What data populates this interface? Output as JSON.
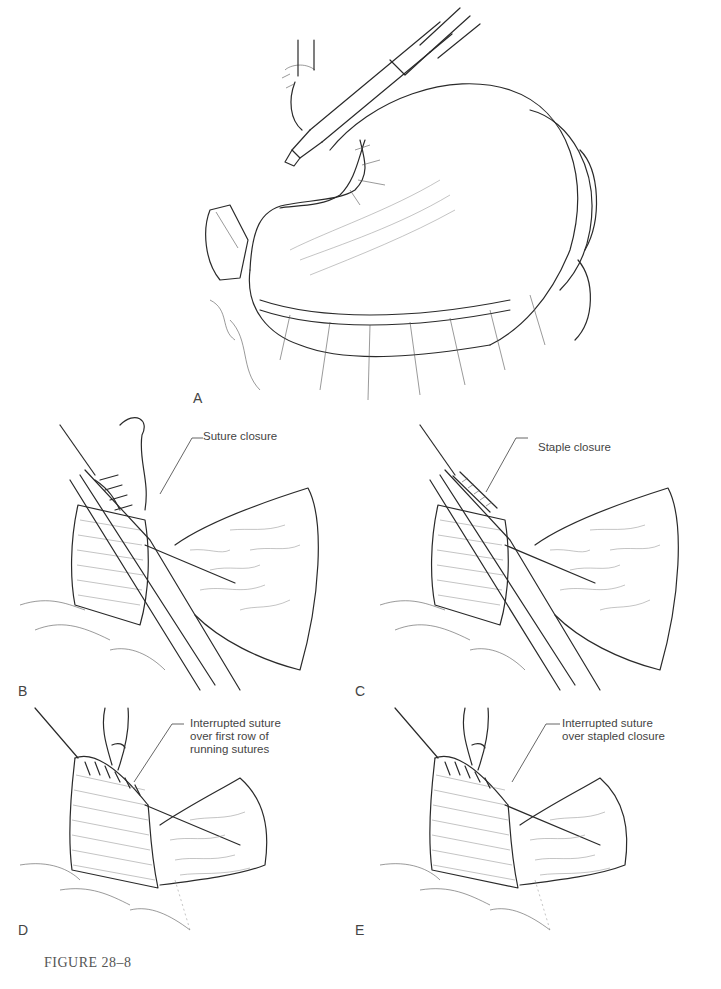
{
  "figure": {
    "caption": "FIGURE 28–8",
    "panels": [
      {
        "id": "A",
        "label": "A",
        "description": "Stomach with stapler instrument at fundus; vascular branches along curvatures",
        "callout": ""
      },
      {
        "id": "B",
        "label": "B",
        "description": "Stump held by clamp with running suture",
        "callout": "Suture closure"
      },
      {
        "id": "C",
        "label": "C",
        "description": "Stump held by clamp with stapled line",
        "callout": "Staple closure"
      },
      {
        "id": "D",
        "label": "D",
        "description": "Second layer of interrupted sutures over running suture",
        "callout": "Interrupted suture\nover first row of\nrunning sutures"
      },
      {
        "id": "E",
        "label": "E",
        "description": "Second layer of interrupted sutures over staples",
        "callout": "Interrupted suture\nover stapled closure"
      }
    ]
  }
}
